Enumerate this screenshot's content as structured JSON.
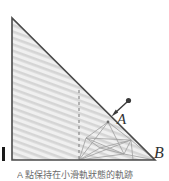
{
  "figure": {
    "kind": "geometry-diagram",
    "canvas": {
      "width": 169,
      "height": 181
    },
    "colors": {
      "outline": "#4a4a4a",
      "hatch_fill": "#d8d8d8",
      "hatch_background": "#efefef",
      "construction_line": "#9a9a9a",
      "dashed_line": "#8a8a8a",
      "arrow": "#3a3a3a",
      "label_text": "#333333",
      "caption_text": "#6b6b6b",
      "edge_mark": "#1a1a1a",
      "page_background": "#ffffff"
    },
    "triangle": {
      "name": "main-right-triangle",
      "vertices": {
        "top": {
          "x": 12,
          "y": 18
        },
        "bottom_left": {
          "x": 12,
          "y": 160
        },
        "bottom_right": {
          "x": 155,
          "y": 160
        }
      },
      "right_angle_at": "bottom_left"
    },
    "dashed_altitude": {
      "name": "dashed-altitude",
      "x": 79,
      "y_top": 90,
      "y_bottom": 160
    },
    "foot_point": {
      "x": 79,
      "y": 160
    },
    "labels": {
      "A": "A",
      "B": "B"
    },
    "label_positions": {
      "A": {
        "x": 117,
        "y": 112
      },
      "B": {
        "x": 154,
        "y": 145
      }
    },
    "arrow": {
      "name": "motion-arrow",
      "dot": {
        "x": 128,
        "y": 101
      },
      "tip": {
        "x": 112,
        "y": 116
      }
    },
    "point_on_hypotenuse": {
      "x": 108,
      "y": 122
    },
    "construction_nodes": [
      {
        "id": "n1",
        "x": 108,
        "y": 122
      },
      {
        "id": "n2",
        "x": 131,
        "y": 140
      },
      {
        "id": "n3",
        "x": 86,
        "y": 138
      },
      {
        "id": "n4",
        "x": 124,
        "y": 154
      },
      {
        "id": "n5",
        "x": 79,
        "y": 160
      },
      {
        "id": "n6",
        "x": 155,
        "y": 160
      },
      {
        "id": "n7",
        "x": 100,
        "y": 148
      }
    ],
    "edge_mark": {
      "name": "left-edge-tick",
      "x": 2,
      "y": 147,
      "width": 3,
      "height": 14
    }
  },
  "caption": {
    "text": "A 點保持在小滑軌狀態的軌跡"
  }
}
